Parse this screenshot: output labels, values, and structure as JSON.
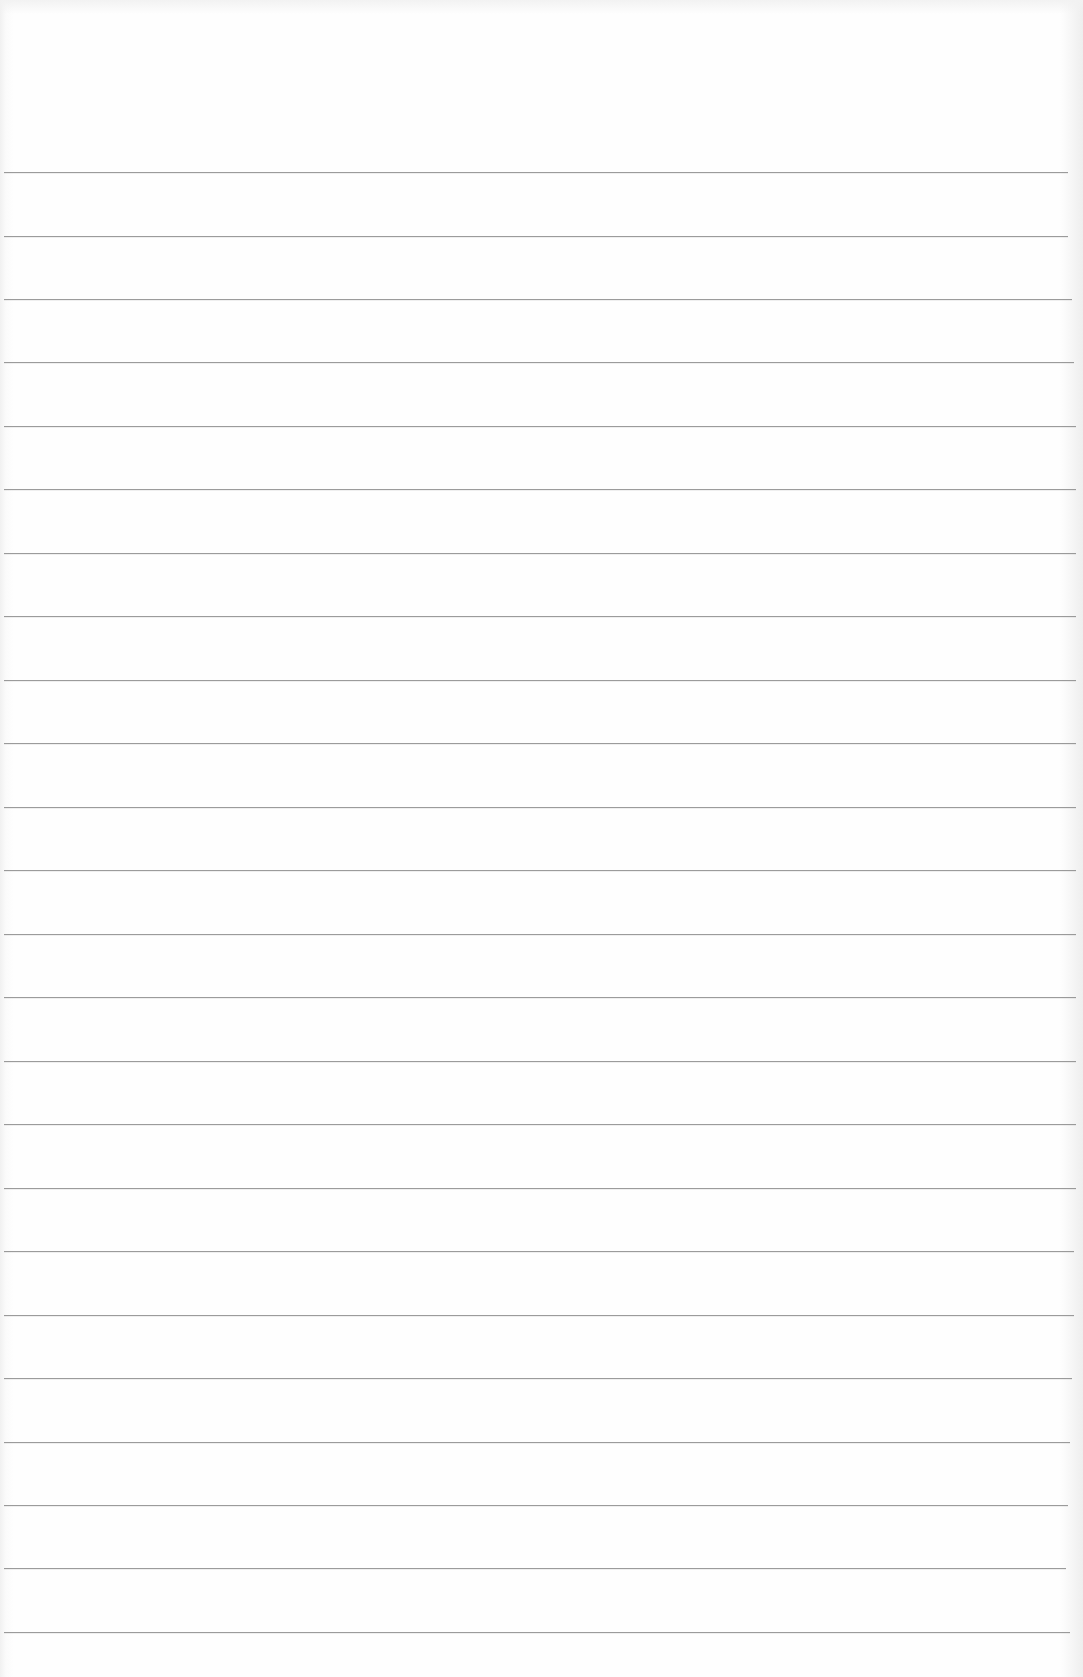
{
  "document": {
    "type": "ruled-paper",
    "text_content": "",
    "line_color": "#8a8a8a",
    "paper_color": "#fefefe",
    "lines": [
      {
        "y": 172,
        "x1": 4,
        "x2": 1068
      },
      {
        "y": 236,
        "x1": 4,
        "x2": 1068
      },
      {
        "y": 299,
        "x1": 4,
        "x2": 1072
      },
      {
        "y": 362,
        "x1": 4,
        "x2": 1074
      },
      {
        "y": 426,
        "x1": 4,
        "x2": 1076
      },
      {
        "y": 489,
        "x1": 4,
        "x2": 1076
      },
      {
        "y": 553,
        "x1": 4,
        "x2": 1076
      },
      {
        "y": 616,
        "x1": 4,
        "x2": 1076
      },
      {
        "y": 680,
        "x1": 4,
        "x2": 1076
      },
      {
        "y": 743,
        "x1": 4,
        "x2": 1076
      },
      {
        "y": 807,
        "x1": 4,
        "x2": 1076
      },
      {
        "y": 870,
        "x1": 4,
        "x2": 1076
      },
      {
        "y": 934,
        "x1": 4,
        "x2": 1076
      },
      {
        "y": 997,
        "x1": 4,
        "x2": 1076
      },
      {
        "y": 1061,
        "x1": 4,
        "x2": 1076
      },
      {
        "y": 1124,
        "x1": 4,
        "x2": 1076
      },
      {
        "y": 1188,
        "x1": 4,
        "x2": 1076
      },
      {
        "y": 1251,
        "x1": 4,
        "x2": 1074
      },
      {
        "y": 1315,
        "x1": 4,
        "x2": 1074
      },
      {
        "y": 1378,
        "x1": 4,
        "x2": 1072
      },
      {
        "y": 1442,
        "x1": 4,
        "x2": 1070
      },
      {
        "y": 1505,
        "x1": 4,
        "x2": 1068
      },
      {
        "y": 1568,
        "x1": 4,
        "x2": 1066
      },
      {
        "y": 1632,
        "x1": 4,
        "x2": 1070
      }
    ]
  }
}
